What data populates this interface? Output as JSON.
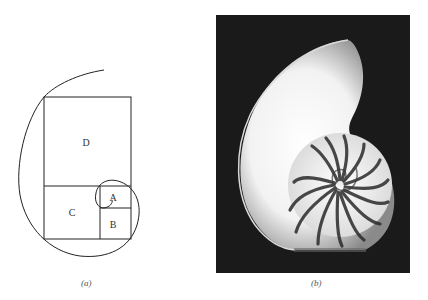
{
  "figure": {
    "panel_a": {
      "caption": "(a)",
      "rectangles": [
        {
          "label": "D",
          "x": 44,
          "y": 97,
          "w": 87,
          "h": 89
        },
        {
          "label": "C",
          "x": 44,
          "y": 186,
          "w": 56,
          "h": 53
        },
        {
          "label": "A",
          "x": 100,
          "y": 186,
          "w": 31,
          "h": 22
        },
        {
          "label": "B",
          "x": 100,
          "y": 208,
          "w": 31,
          "h": 31
        }
      ],
      "spiral_stroke": "#222222"
    },
    "panel_b": {
      "caption": "(b)",
      "description": "Photograph of a cross-sectioned nautilus shell on dark background",
      "background_color": "#1a1a1a",
      "shell_color": "#f4f4f4"
    }
  }
}
